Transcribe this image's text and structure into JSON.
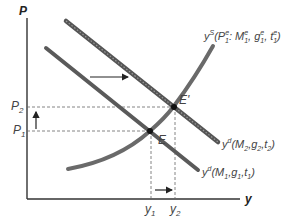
{
  "diagram": {
    "type": "AD-AS shift (economics)",
    "axes": {
      "y_label": "P",
      "x_label": "y"
    },
    "price_levels": [
      {
        "label": "P",
        "sub": "2"
      },
      {
        "label": "P",
        "sub": "1"
      }
    ],
    "output_levels": [
      {
        "label": "y",
        "sub": "1"
      },
      {
        "label": "y",
        "sub": "2"
      }
    ],
    "points": [
      {
        "name": "E",
        "label": "E"
      },
      {
        "name": "E-prime",
        "label": "E'"
      }
    ],
    "curves": {
      "supply": {
        "main": "y",
        "sup": "S",
        "args": "(P",
        "a1sub": "1",
        "a1sup": "e",
        "a2": ": M",
        "a2sub": "1",
        "a2sup": "e",
        "a3": ", g",
        "a3sub": "1",
        "a3sup": "e",
        "a4": ", t",
        "a4sub": "1",
        "a4sup": "e",
        "close": ")"
      },
      "demand_new": {
        "main": "y",
        "sup": "d",
        "args": "(M",
        "s1": "2",
        "c1": ",g",
        "s2": "2",
        "c2": ",t",
        "s3": "2",
        "close": ")"
      },
      "demand_old": {
        "main": "y",
        "sup": "d",
        "args": "(M",
        "s1": "1",
        "c1": ",g",
        "s2": "1",
        "c2": ",t",
        "s3": "1",
        "close": ")"
      }
    },
    "colors": {
      "curve": "#5a5a5a",
      "axis": "#333333",
      "dashed": "#666666",
      "arrow": "#222222"
    }
  }
}
